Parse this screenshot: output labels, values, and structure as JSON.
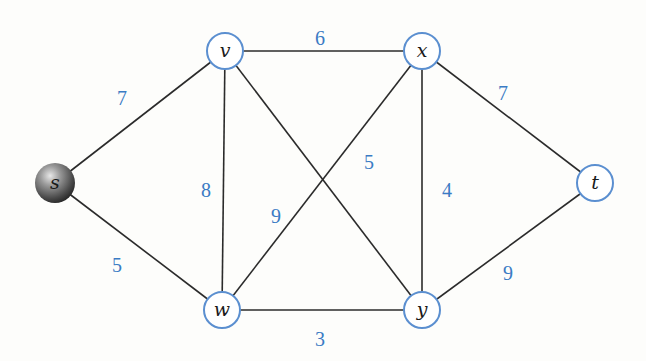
{
  "graph": {
    "type": "weighted-undirected-graph",
    "source": "s",
    "colors": {
      "node_stroke": "#5b8fd0",
      "weight_text": "#3a7bc4",
      "edge": "#2b2b2b"
    },
    "nodes": [
      {
        "id": "s",
        "label": "s",
        "style": "shaded-sphere"
      },
      {
        "id": "v",
        "label": "v",
        "style": "circle"
      },
      {
        "id": "x",
        "label": "x",
        "style": "circle"
      },
      {
        "id": "t",
        "label": "t",
        "style": "circle"
      },
      {
        "id": "w",
        "label": "w",
        "style": "circle"
      },
      {
        "id": "y",
        "label": "y",
        "style": "circle"
      }
    ],
    "edges": [
      {
        "from": "s",
        "to": "v",
        "weight": "7"
      },
      {
        "from": "s",
        "to": "w",
        "weight": "5"
      },
      {
        "from": "v",
        "to": "x",
        "weight": "6"
      },
      {
        "from": "v",
        "to": "w",
        "weight": "8"
      },
      {
        "from": "v",
        "to": "y",
        "weight": "5"
      },
      {
        "from": "x",
        "to": "w",
        "weight": "9"
      },
      {
        "from": "x",
        "to": "y",
        "weight": "4"
      },
      {
        "from": "x",
        "to": "t",
        "weight": "7"
      },
      {
        "from": "w",
        "to": "y",
        "weight": "3"
      },
      {
        "from": "y",
        "to": "t",
        "weight": "9"
      }
    ]
  }
}
